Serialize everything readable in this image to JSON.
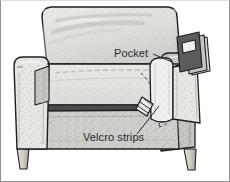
{
  "figure": {
    "style": "grayscale line drawing with stipple shading",
    "colors": {
      "outline": "#1f1f1f",
      "upholstery_light": "#e4e4e2",
      "upholstery_mid": "#cfcfcc",
      "upholstery_shadow": "#a9a9a6",
      "seat_gap": "#4a4a48",
      "leg_wood": "#cfcac2",
      "pocket_face": "#efefed",
      "insert_dark": "#5b5b5b",
      "frame_border": "#8f9194",
      "label_text": "#2b2b2b",
      "background": "#ffffff"
    }
  },
  "labels": [
    {
      "id": "pocket",
      "text": "Pocket",
      "x": 113,
      "y": 56,
      "leader_from": [
        152,
        53
      ],
      "leader_to": [
        171,
        61
      ]
    },
    {
      "id": "velcro-strips",
      "text": "Velcro strips",
      "x": 82,
      "y": 140,
      "leader_from": [
        136,
        133
      ],
      "leader_to": [
        158,
        105
      ]
    }
  ],
  "parts": {
    "backrest": "backrest",
    "left_armrest": "left-armrest",
    "right_armrest": "right-armrest",
    "seat_cushion": "seat-cushion",
    "front_skirt": "front-skirt",
    "front_left_leg": "front-left-leg",
    "front_right_leg": "front-right-leg",
    "side_pocket": "side-pocket",
    "pocket_flap": "pocket-flap",
    "velcro_tab": "velcro-tab",
    "inserted_item": "magazine-insert"
  }
}
